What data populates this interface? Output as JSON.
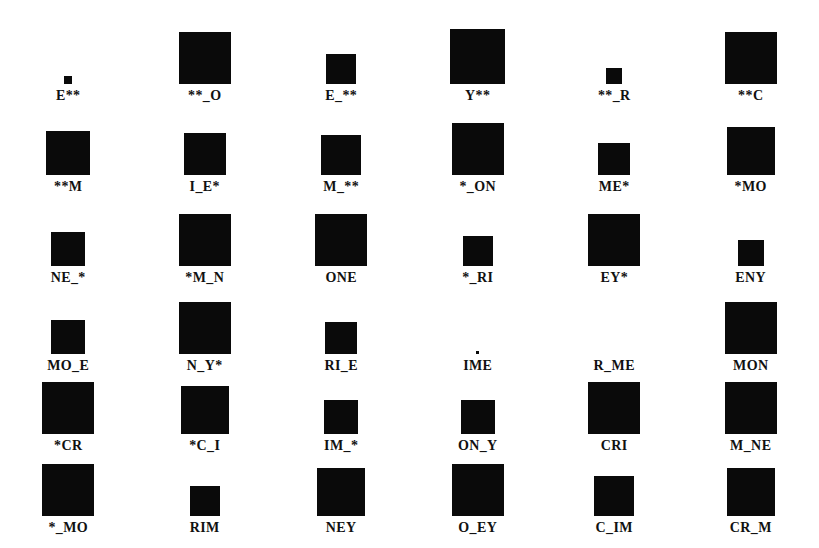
{
  "figure": {
    "type": "proportional-square-grid",
    "background_color": "#ffffff",
    "square_color": "#0a0a0a",
    "label_color": "#111111",
    "columns": 6,
    "rows": 6,
    "row_height": 91,
    "label_gap": 4,
    "column_width": 136.5,
    "swatch_band_height": 62
  },
  "chart_data": {
    "type": "heatmap",
    "title": "",
    "subtitle": "",
    "xlabel": "",
    "ylabel": "",
    "legend": [],
    "grid": false,
    "encoding": "Area of filled black square encodes the magnitude associated with each word-fragment cue label.",
    "categories": [
      "E**",
      "**_O",
      "E_**",
      "Y**",
      "**_R",
      "**C",
      "**M",
      "I_E*",
      "M_**",
      "*_ON",
      "ME*",
      "*MO",
      "NE_*",
      "*M_N",
      "ONE",
      "*_RI",
      "EY*",
      "ENY",
      "MO_E",
      "N_Y*",
      "RI_E",
      "IME",
      "R_ME",
      "MON",
      "*CR",
      "*C_I",
      "IM_*",
      "ON_Y",
      "CRI",
      "M_NE",
      "*_MO",
      "RIM",
      "NEY",
      "O_EY",
      "C_IM",
      "CR_M"
    ],
    "values": [
      8,
      52,
      30,
      55,
      16,
      52,
      44,
      42,
      40,
      52,
      32,
      48,
      34,
      52,
      52,
      30,
      52,
      26,
      34,
      52,
      32,
      3,
      0,
      52,
      52,
      48,
      34,
      34,
      52,
      52,
      52,
      30,
      48,
      52,
      40,
      48
    ],
    "rows": [
      {
        "index": 1,
        "cells": [
          {
            "label": "E**",
            "size": 8,
            "x_center": 63
          },
          {
            "label": "**_O",
            "size": 52,
            "x_center": 196
          },
          {
            "label": "E_**",
            "size": 30,
            "x_center": 339
          },
          {
            "label": "Y**",
            "size": 55,
            "x_center": 481
          },
          {
            "label": "**_R",
            "size": 16,
            "x_center": 620
          },
          {
            "label": "**C",
            "size": 52,
            "x_center": 755
          }
        ]
      },
      {
        "index": 2,
        "cells": [
          {
            "label": "**M",
            "size": 44,
            "x_center": 63
          },
          {
            "label": "I_E*",
            "size": 42,
            "x_center": 196
          },
          {
            "label": "M_**",
            "size": 40,
            "x_center": 339
          },
          {
            "label": "*_ON",
            "size": 52,
            "x_center": 481
          },
          {
            "label": "ME*",
            "size": 32,
            "x_center": 620
          },
          {
            "label": "*MO",
            "size": 48,
            "x_center": 755
          }
        ]
      },
      {
        "index": 3,
        "cells": [
          {
            "label": "NE_*",
            "size": 34,
            "x_center": 63
          },
          {
            "label": "*M_N",
            "size": 52,
            "x_center": 196
          },
          {
            "label": "ONE",
            "size": 52,
            "x_center": 339
          },
          {
            "label": "*_RI",
            "size": 30,
            "x_center": 481
          },
          {
            "label": "EY*",
            "size": 52,
            "x_center": 620
          },
          {
            "label": "ENY",
            "size": 26,
            "x_center": 755
          }
        ]
      },
      {
        "index": 4,
        "cells": [
          {
            "label": "MO_E",
            "size": 34,
            "x_center": 63
          },
          {
            "label": "N_Y*",
            "size": 52,
            "x_center": 196
          },
          {
            "label": "RI_E",
            "size": 32,
            "x_center": 339
          },
          {
            "label": "IME",
            "size": 3,
            "x_center": 481
          },
          {
            "label": "R_ME",
            "size": 0,
            "x_center": 620
          },
          {
            "label": "MON",
            "size": 52,
            "x_center": 755
          }
        ]
      },
      {
        "index": 5,
        "cells": [
          {
            "label": "*CR",
            "size": 52,
            "x_center": 63
          },
          {
            "label": "*C_I",
            "size": 48,
            "x_center": 196
          },
          {
            "label": "IM_*",
            "size": 34,
            "x_center": 339
          },
          {
            "label": "ON_Y",
            "size": 34,
            "x_center": 481
          },
          {
            "label": "CRI",
            "size": 52,
            "x_center": 620
          },
          {
            "label": "M_NE",
            "size": 52,
            "x_center": 755
          }
        ]
      },
      {
        "index": 6,
        "cells": [
          {
            "label": "*_MO",
            "size": 52,
            "x_center": 63
          },
          {
            "label": "RIM",
            "size": 30,
            "x_center": 196
          },
          {
            "label": "NEY",
            "size": 48,
            "x_center": 339
          },
          {
            "label": "O_EY",
            "size": 52,
            "x_center": 481
          },
          {
            "label": "C_IM",
            "size": 40,
            "x_center": 620
          },
          {
            "label": "CR_M",
            "size": 48,
            "x_center": 755
          }
        ]
      }
    ]
  }
}
